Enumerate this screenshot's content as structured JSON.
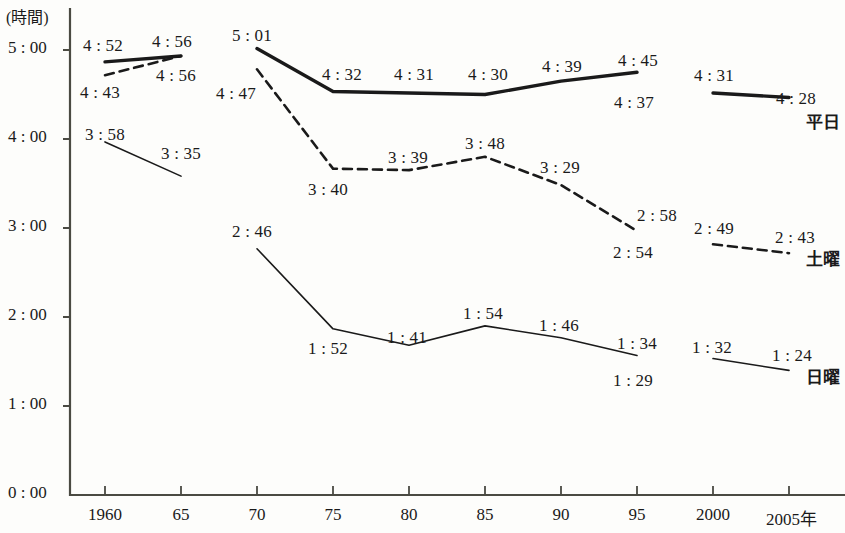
{
  "axis": {
    "unit_label": "(時間)",
    "y_ticks": [
      "5 : 00",
      "4 : 00",
      "3 : 00",
      "2 : 00",
      "1 : 00",
      "0 : 00"
    ],
    "x_ticks": [
      "1960",
      "65",
      "70",
      "75",
      "80",
      "85",
      "90",
      "95",
      "2000",
      "2005年"
    ],
    "axis_color": "#4a4a42"
  },
  "series_labels": {
    "weekday": "平日",
    "saturday": "土曜",
    "sunday": "日曜"
  },
  "chart_data": {
    "type": "line",
    "title": "",
    "xlabel": "",
    "ylabel": "(時間)",
    "ylim": [
      0,
      5
    ],
    "grid": false,
    "legend": "right-inline",
    "x": [
      1960,
      1965,
      1970,
      1975,
      1980,
      1985,
      1990,
      1995,
      2000,
      2005
    ],
    "xtick_labels": [
      "1960",
      "65",
      "70",
      "75",
      "80",
      "85",
      "90",
      "95",
      "2000",
      "2005年"
    ],
    "ytick_labels": [
      "0 : 00",
      "1 : 00",
      "2 : 00",
      "3 : 00",
      "4 : 00",
      "5 : 00"
    ],
    "series": [
      {
        "name": "平日",
        "style": "thick-solid",
        "color": "#1a1a1a",
        "points": [
          {
            "x": 1960,
            "label": "4 : 52",
            "hours": 4.867,
            "label_pos": "above"
          },
          {
            "x": 1965,
            "label": "4 : 56",
            "hours": 4.933,
            "label_pos": "above"
          },
          {
            "x": 1970,
            "label": "5 : 01",
            "hours": 5.017,
            "label_pos": "above"
          },
          {
            "x": 1975,
            "label": "4 : 32",
            "hours": 4.533,
            "label_pos": "above"
          },
          {
            "x": 1980,
            "label": "4 : 31",
            "hours": 4.517,
            "label_pos": "above"
          },
          {
            "x": 1985,
            "label": "4 : 30",
            "hours": 4.5,
            "label_pos": "above"
          },
          {
            "x": 1990,
            "label": "4 : 39",
            "hours": 4.65,
            "label_pos": "above"
          },
          {
            "x": 1995,
            "label": "4 : 45",
            "hours": 4.75,
            "label_pos": "above"
          },
          {
            "x": 1995,
            "label": "4 : 37",
            "hours": 4.617,
            "label_pos": "below"
          },
          {
            "x": 2000,
            "label": "4 : 31",
            "hours": 4.517,
            "label_pos": "above"
          },
          {
            "x": 2005,
            "label": "4 : 28",
            "hours": 4.467,
            "label_pos": "above"
          }
        ],
        "breaks_after_x": [
          1965,
          1995
        ]
      },
      {
        "name": "土曜",
        "style": "dashed",
        "color": "#1a1a1a",
        "points": [
          {
            "x": 1960,
            "label": "4 : 43",
            "hours": 4.717,
            "label_pos": "below"
          },
          {
            "x": 1965,
            "label": "4 : 56",
            "hours": 4.933,
            "label_pos": "below"
          },
          {
            "x": 1970,
            "label": "4 : 47",
            "hours": 4.783,
            "label_pos": "left"
          },
          {
            "x": 1975,
            "label": "3 : 40",
            "hours": 3.667,
            "label_pos": "below"
          },
          {
            "x": 1980,
            "label": "3 : 39",
            "hours": 3.65,
            "label_pos": "above"
          },
          {
            "x": 1985,
            "label": "3 : 48",
            "hours": 3.8,
            "label_pos": "above"
          },
          {
            "x": 1990,
            "label": "3 : 29",
            "hours": 3.483,
            "label_pos": "above"
          },
          {
            "x": 1995,
            "label": "2 : 58",
            "hours": 2.967,
            "label_pos": "above"
          },
          {
            "x": 1995,
            "label": "2 : 54",
            "hours": 2.9,
            "label_pos": "below"
          },
          {
            "x": 2000,
            "label": "2 : 49",
            "hours": 2.817,
            "label_pos": "above"
          },
          {
            "x": 2005,
            "label": "2 : 43",
            "hours": 2.717,
            "label_pos": "above"
          }
        ],
        "breaks_after_x": [
          1965,
          1995
        ]
      },
      {
        "name": "日曜",
        "style": "thin-solid",
        "color": "#1a1a1a",
        "points": [
          {
            "x": 1960,
            "label": "3 : 58",
            "hours": 3.967,
            "label_pos": "above"
          },
          {
            "x": 1965,
            "label": "3 : 35",
            "hours": 3.583,
            "label_pos": "above"
          },
          {
            "x": 1970,
            "label": "2 : 46",
            "hours": 2.767,
            "label_pos": "above"
          },
          {
            "x": 1975,
            "label": "1 : 52",
            "hours": 1.867,
            "label_pos": "below"
          },
          {
            "x": 1980,
            "label": "1 : 41",
            "hours": 1.683,
            "label_pos": "above"
          },
          {
            "x": 1985,
            "label": "1 : 54",
            "hours": 1.9,
            "label_pos": "above"
          },
          {
            "x": 1990,
            "label": "1 : 46",
            "hours": 1.767,
            "label_pos": "above"
          },
          {
            "x": 1995,
            "label": "1 : 34",
            "hours": 1.567,
            "label_pos": "above"
          },
          {
            "x": 1995,
            "label": "1 : 29",
            "hours": 1.483,
            "label_pos": "below"
          },
          {
            "x": 2000,
            "label": "1 : 32",
            "hours": 1.533,
            "label_pos": "above"
          },
          {
            "x": 2005,
            "label": "1 : 24",
            "hours": 1.4,
            "label_pos": "above"
          }
        ],
        "breaks_after_x": [
          1965,
          1995
        ]
      }
    ]
  },
  "value_labels": {
    "weekday": [
      {
        "text": "4 : 52",
        "x": 83,
        "y": 36
      },
      {
        "text": "4 : 56",
        "x": 152,
        "y": 32
      },
      {
        "text": "5 : 01",
        "x": 232,
        "y": 26
      },
      {
        "text": "4 : 32",
        "x": 322,
        "y": 65
      },
      {
        "text": "4 : 31",
        "x": 394,
        "y": 65
      },
      {
        "text": "4 : 30",
        "x": 468,
        "y": 65
      },
      {
        "text": "4 : 39",
        "x": 542,
        "y": 57
      },
      {
        "text": "4 : 45",
        "x": 618,
        "y": 51
      },
      {
        "text": "4 : 37",
        "x": 614,
        "y": 93
      },
      {
        "text": "4 : 31",
        "x": 694,
        "y": 66
      },
      {
        "text": "4 : 28",
        "x": 776,
        "y": 89
      }
    ],
    "saturday": [
      {
        "text": "4 : 43",
        "x": 80,
        "y": 83
      },
      {
        "text": "4 : 56",
        "x": 156,
        "y": 66
      },
      {
        "text": "4 : 47",
        "x": 216,
        "y": 84
      },
      {
        "text": "3 : 40",
        "x": 308,
        "y": 180
      },
      {
        "text": "3 : 39",
        "x": 388,
        "y": 148
      },
      {
        "text": "3 : 48",
        "x": 465,
        "y": 134
      },
      {
        "text": "3 : 29",
        "x": 540,
        "y": 158
      },
      {
        "text": "2 : 58",
        "x": 637,
        "y": 206
      },
      {
        "text": "2 : 54",
        "x": 613,
        "y": 243
      },
      {
        "text": "2 : 49",
        "x": 694,
        "y": 219
      },
      {
        "text": "2 : 43",
        "x": 775,
        "y": 228
      }
    ],
    "sunday": [
      {
        "text": "3 : 58",
        "x": 85,
        "y": 125
      },
      {
        "text": "3 : 35",
        "x": 161,
        "y": 144
      },
      {
        "text": "2 : 46",
        "x": 232,
        "y": 222
      },
      {
        "text": "1 : 52",
        "x": 308,
        "y": 339
      },
      {
        "text": "1 : 41",
        "x": 387,
        "y": 328
      },
      {
        "text": "1 : 54",
        "x": 463,
        "y": 304
      },
      {
        "text": "1 : 46",
        "x": 539,
        "y": 316
      },
      {
        "text": "1 : 34",
        "x": 617,
        "y": 334
      },
      {
        "text": "1 : 29",
        "x": 613,
        "y": 371
      },
      {
        "text": "1 : 32",
        "x": 692,
        "y": 338
      },
      {
        "text": "1 : 24",
        "x": 772,
        "y": 346
      }
    ]
  }
}
